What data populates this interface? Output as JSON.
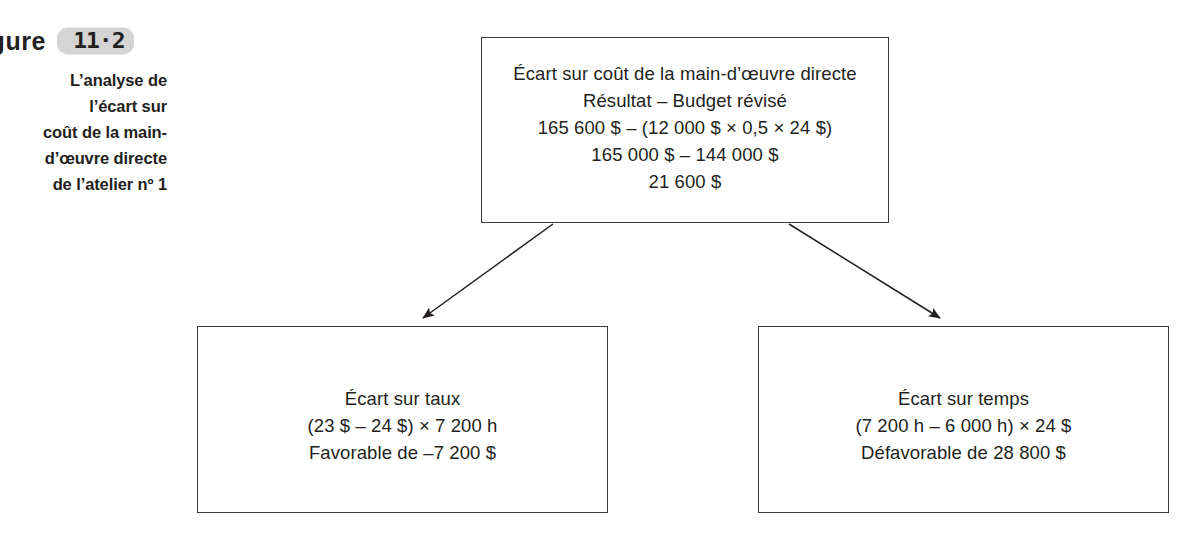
{
  "figure": {
    "label_word": "igure",
    "number_badge": "11·2",
    "caption_lines": [
      "L’analyse de",
      "l’écart sur",
      "coût de la main-",
      "d’œuvre directe",
      "de l’atelier nº 1"
    ]
  },
  "diagram": {
    "type": "variance-analysis-tree",
    "boxes": {
      "top": {
        "name": "ecart-sur-cout-main-doeuvre-directe",
        "lines": [
          "Écart sur coût de la main-d’œuvre directe",
          "Résultat – Budget révisé",
          "165 600 $ – (12 000 $ × 0,5 × 24 $)",
          "165 000 $ – 144 000 $",
          "21 600 $"
        ]
      },
      "left": {
        "name": "ecart-sur-taux",
        "lines": [
          "Écart sur taux",
          "(23 $ – 24 $) × 7 200 h",
          "Favorable de –7 200 $"
        ]
      },
      "right": {
        "name": "ecart-sur-temps",
        "lines": [
          "Écart sur temps",
          "(7 200 h – 6 000 h) × 24 $",
          "Défavorable de 28 800 $"
        ]
      }
    },
    "connectors": [
      {
        "name": "arrow-top-to-left",
        "from": "top",
        "to": "left"
      },
      {
        "name": "arrow-top-to-right",
        "from": "top",
        "to": "right"
      }
    ]
  },
  "colors": {
    "ink": "#231f20",
    "box_border": "#3b3b3b",
    "badge_fill": "#d4d4d4",
    "page_background": "#ffffff"
  }
}
